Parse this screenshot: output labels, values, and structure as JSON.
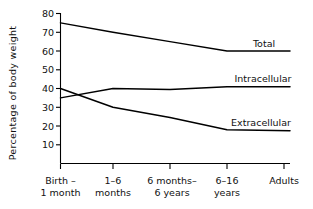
{
  "chart_data": {
    "type": "line",
    "title": "",
    "xlabel": "",
    "ylabel": "Percentage of body weight",
    "ylim": [
      0,
      80
    ],
    "yticks": [
      10,
      20,
      30,
      40,
      50,
      60,
      70,
      80
    ],
    "ytick_labels": [
      "10",
      "20",
      "30",
      "40",
      "50",
      "60",
      "70",
      "80"
    ],
    "grid": false,
    "legend": "inline-right-of-line-ends",
    "categories": [
      {
        "line1": "Birth –",
        "line2": "1 month"
      },
      {
        "line1": "1–6",
        "line2": "months"
      },
      {
        "line1": "6 months–",
        "line2": "6 years"
      },
      {
        "line1": "6–16",
        "line2": "years"
      },
      {
        "line1": "Adults",
        "line2": ""
      }
    ],
    "category_labels": [
      "Birth – 1 month",
      "1–6 months",
      "6 months– 6 years",
      "6–16 years",
      "Adults"
    ],
    "series": [
      {
        "name": "Total",
        "values": [
          75,
          70,
          65,
          60,
          60
        ]
      },
      {
        "name": "Intracellular",
        "values": [
          35,
          40,
          39.5,
          41,
          41
        ]
      },
      {
        "name": "Extracellular",
        "values": [
          40,
          30,
          24.5,
          18,
          17.5
        ]
      }
    ],
    "colors": {
      "line": "#000000",
      "background": "#ffffff",
      "text": "#111111"
    }
  }
}
